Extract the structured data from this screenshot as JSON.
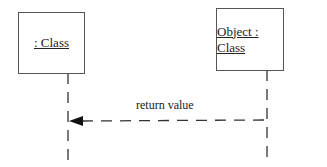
{
  "diagram": {
    "type": "UML sequence diagram",
    "lifelines": [
      {
        "label": ": Class"
      },
      {
        "label": "Object : Class"
      }
    ],
    "messages": [
      {
        "label": "return value",
        "from": "Object : Class",
        "to": ": Class",
        "style": "dashed",
        "arrowhead": "filled"
      }
    ]
  }
}
